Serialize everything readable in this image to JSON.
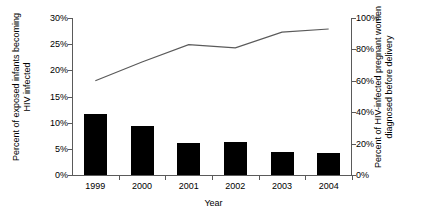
{
  "chart_data": {
    "type": "bar",
    "title": "",
    "xlabel": "Year",
    "categories": [
      "1999",
      "2000",
      "2001",
      "2002",
      "2003",
      "2004"
    ],
    "series": [
      {
        "name": "Percent of exposed infants becoming HIV infected",
        "type": "bar",
        "axis": "left",
        "values": [
          11.7,
          9.4,
          6.2,
          6.4,
          4.4,
          4.2
        ],
        "color": "#000000"
      },
      {
        "name": "Percent of HIV-infected pregnant women diagnosed before delivery",
        "type": "line",
        "axis": "right",
        "values": [
          60,
          72,
          83,
          81,
          91,
          93
        ],
        "color": "#5a5a5a"
      }
    ],
    "left_axis": {
      "label": "Percent of exposed infants becoming\nHIV infected",
      "ticks": [
        "0%",
        "5%",
        "10%",
        "15%",
        "20%",
        "25%",
        "30%"
      ],
      "tick_values": [
        0,
        5,
        10,
        15,
        20,
        25,
        30
      ],
      "ylim": [
        0,
        30
      ]
    },
    "right_axis": {
      "label": "Percent of HIV-infected pregnant women\ndiagnosed before delivery",
      "ticks": [
        "0%",
        "20%",
        "40%",
        "60%",
        "80%",
        "100%"
      ],
      "tick_values": [
        0,
        20,
        40,
        60,
        80,
        100
      ],
      "ylim": [
        0,
        100
      ]
    },
    "grid": false,
    "legend": "none"
  }
}
